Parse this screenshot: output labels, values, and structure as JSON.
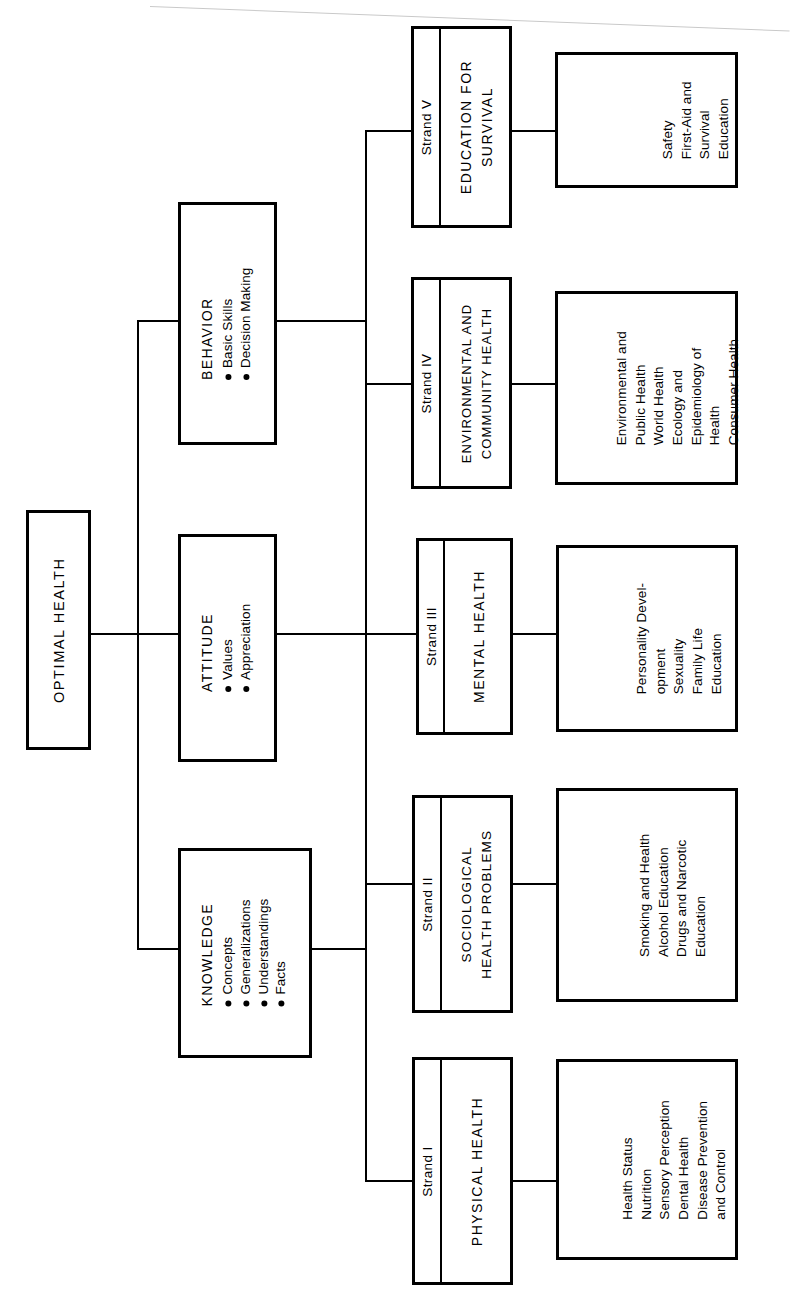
{
  "diagram": {
    "title": "OPTIMAL HEALTH",
    "orientation": "rotated-90-counterclockwise",
    "root": {
      "label": "OPTIMAL HEALTH"
    },
    "domains": [
      {
        "name": "KNOWLEDGE",
        "items": [
          "Concepts",
          "Generalizations",
          "Understandings",
          "Facts"
        ]
      },
      {
        "name": "ATTITUDE",
        "items": [
          "Values",
          "Appreciation"
        ]
      },
      {
        "name": "BEHAVIOR",
        "items": [
          "Basic Skills",
          "Decision Making"
        ]
      }
    ],
    "strands": [
      {
        "number": "Strand I",
        "title_lines": [
          "PHYSICAL HEALTH"
        ],
        "topics": [
          "Health Status",
          "Nutrition",
          "Sensory Perception",
          "Dental Health",
          "Disease Prevention",
          "   and Control"
        ]
      },
      {
        "number": "Strand II",
        "title_lines": [
          "SOCIOLOGICAL",
          "HEALTH PROBLEMS"
        ],
        "topics": [
          "Smoking and Health",
          "Alcohol Education",
          "Drugs and Narcotic",
          "   Education"
        ]
      },
      {
        "number": "Strand III",
        "title_lines": [
          "MENTAL HEALTH"
        ],
        "topics": [
          "Personality Devel-",
          "   opment",
          "Sexuality",
          "Family Life",
          "   Education"
        ]
      },
      {
        "number": "Strand IV",
        "title_lines": [
          "ENVIRONMENTAL AND",
          "COMMUNITY HEALTH"
        ],
        "topics": [
          "Environmental and",
          "   Public Health",
          "World Health",
          "Ecology and",
          "   Epidemiology of",
          "   Health",
          "Consumer Health"
        ]
      },
      {
        "number": "Strand V",
        "title_lines": [
          "EDUCATION FOR",
          "SURVIVAL"
        ],
        "topics": [
          "Safety",
          "First-Aid and",
          "   Survival",
          "   Education"
        ]
      }
    ]
  }
}
